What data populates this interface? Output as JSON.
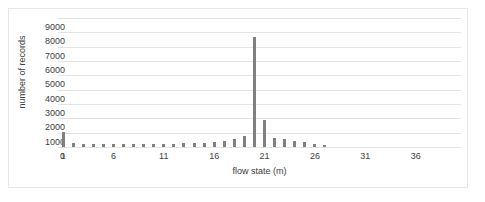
{
  "chart_data": {
    "type": "bar",
    "title": "",
    "xlabel": "flow state (m)",
    "ylabel": "number of records",
    "grid": true,
    "legend": false,
    "bar_color": "#808080",
    "gridline_color": "#e3e3e3",
    "text_color": "#404040",
    "ylim": [
      0,
      9000
    ],
    "ytick_values": [
      0,
      1000,
      2000,
      3000,
      4000,
      5000,
      6000,
      7000,
      8000,
      9000
    ],
    "ytick_labels": [
      "0",
      "1000",
      "2000",
      "3000",
      "4000",
      "5000",
      "6000",
      "7000",
      "8000",
      "9000"
    ],
    "xlim": [
      0.5,
      40.5
    ],
    "xtick_values": [
      1,
      6,
      11,
      16,
      21,
      26,
      31,
      36
    ],
    "xtick_labels": [
      "1",
      "6",
      "11",
      "16",
      "21",
      "26",
      "31",
      "36"
    ],
    "categories": [
      1,
      2,
      3,
      4,
      5,
      6,
      7,
      8,
      9,
      10,
      11,
      12,
      13,
      14,
      15,
      16,
      17,
      18,
      19,
      20,
      21,
      22,
      23,
      24,
      25,
      26,
      27,
      28,
      29,
      30,
      31,
      32,
      33,
      34,
      35,
      36,
      37,
      38,
      39,
      40
    ],
    "values": [
      1020,
      250,
      210,
      190,
      200,
      200,
      210,
      200,
      210,
      220,
      230,
      240,
      250,
      260,
      300,
      330,
      420,
      560,
      780,
      7650,
      1900,
      620,
      560,
      420,
      330,
      190,
      160,
      0,
      0,
      0,
      0,
      0,
      0,
      0,
      0,
      0,
      0,
      0,
      0,
      0
    ]
  }
}
